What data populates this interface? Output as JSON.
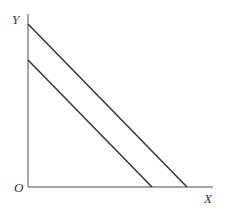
{
  "diagram": {
    "type": "budget-line-shift",
    "axes": {
      "y_label": "Y",
      "x_label": "X",
      "origin_label": "O",
      "color": "#888888"
    },
    "lines": [
      {
        "name": "outer-line",
        "x1": 28,
        "y1": 24,
        "x2": 187,
        "y2": 187,
        "color": "#333333"
      },
      {
        "name": "inner-line",
        "x1": 28,
        "y1": 60,
        "x2": 152,
        "y2": 187,
        "color": "#333333"
      }
    ]
  }
}
